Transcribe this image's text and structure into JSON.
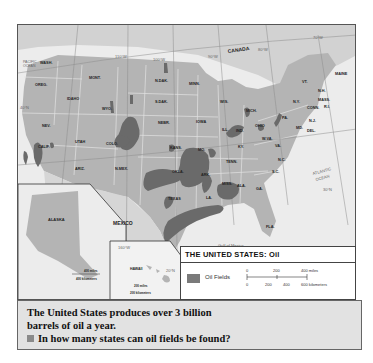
{
  "map": {
    "title": "THE UNITED STATES: Oil",
    "countries": {
      "canada": "CANADA",
      "mexico": "MEXICO"
    },
    "oceans": {
      "pacific": "PACIFIC OCEAN",
      "atlantic": "ATLANTIC OCEAN",
      "gulf": "Gulf of Mexico"
    },
    "meridians": [
      "110°W",
      "100°W",
      "90°W",
      "80°W",
      "70°W"
    ],
    "parallels": [
      "40°N",
      "30°N",
      "20°N"
    ],
    "states": [
      {
        "abbr": "WASH.",
        "x": 22,
        "y": 39
      },
      {
        "abbr": "OREG.",
        "x": 17,
        "y": 61
      },
      {
        "abbr": "IDAHO",
        "x": 49,
        "y": 75
      },
      {
        "abbr": "MONT.",
        "x": 71,
        "y": 54
      },
      {
        "abbr": "WYO.",
        "x": 84,
        "y": 85
      },
      {
        "abbr": "N.DAK.",
        "x": 137,
        "y": 57
      },
      {
        "abbr": "S.DAK.",
        "x": 137,
        "y": 78
      },
      {
        "abbr": "NEBR.",
        "x": 140,
        "y": 99
      },
      {
        "abbr": "NEV.",
        "x": 24,
        "y": 102
      },
      {
        "abbr": "UTAH",
        "x": 57,
        "y": 118
      },
      {
        "abbr": "COLO.",
        "x": 88,
        "y": 120
      },
      {
        "abbr": "CALIF.",
        "x": 20,
        "y": 123
      },
      {
        "abbr": "ARIZ.",
        "x": 57,
        "y": 145
      },
      {
        "abbr": "N.MEX.",
        "x": 97,
        "y": 145
      },
      {
        "abbr": "KANS.",
        "x": 152,
        "y": 124
      },
      {
        "abbr": "OKLA.",
        "x": 154,
        "y": 148
      },
      {
        "abbr": "TEXAS",
        "x": 150,
        "y": 175
      },
      {
        "abbr": "MINN.",
        "x": 171,
        "y": 60
      },
      {
        "abbr": "IOWA",
        "x": 178,
        "y": 98
      },
      {
        "abbr": "MO.",
        "x": 180,
        "y": 126
      },
      {
        "abbr": "ARK.",
        "x": 183,
        "y": 151
      },
      {
        "abbr": "LA.",
        "x": 188,
        "y": 174
      },
      {
        "abbr": "WIS.",
        "x": 202,
        "y": 78
      },
      {
        "abbr": "ILL.",
        "x": 204,
        "y": 106
      },
      {
        "abbr": "MICH.",
        "x": 228,
        "y": 87
      },
      {
        "abbr": "IND.",
        "x": 218,
        "y": 107
      },
      {
        "abbr": "OHIO",
        "x": 237,
        "y": 102
      },
      {
        "abbr": "KY.",
        "x": 220,
        "y": 123
      },
      {
        "abbr": "TENN.",
        "x": 208,
        "y": 138
      },
      {
        "abbr": "MISS.",
        "x": 204,
        "y": 160
      },
      {
        "abbr": "ALA.",
        "x": 219,
        "y": 162
      },
      {
        "abbr": "GA.",
        "x": 238,
        "y": 165
      },
      {
        "abbr": "FLA.",
        "x": 248,
        "y": 203
      },
      {
        "abbr": "S.C.",
        "x": 254,
        "y": 148
      },
      {
        "abbr": "N.C.",
        "x": 260,
        "y": 136
      },
      {
        "abbr": "VA.",
        "x": 257,
        "y": 122
      },
      {
        "abbr": "W.VA.",
        "x": 244,
        "y": 115
      },
      {
        "abbr": "PA.",
        "x": 264,
        "y": 94
      },
      {
        "abbr": "N.Y.",
        "x": 275,
        "y": 78
      },
      {
        "abbr": "MD.",
        "x": 278,
        "y": 104
      },
      {
        "abbr": "DEL.",
        "x": 289,
        "y": 107
      },
      {
        "abbr": "N.J.",
        "x": 291,
        "y": 97
      },
      {
        "abbr": "CONN.",
        "x": 289,
        "y": 84
      },
      {
        "abbr": "R.I.",
        "x": 306,
        "y": 83
      },
      {
        "abbr": "MASS.",
        "x": 300,
        "y": 76
      },
      {
        "abbr": "N.H.",
        "x": 300,
        "y": 67
      },
      {
        "abbr": "VT.",
        "x": 284,
        "y": 58
      },
      {
        "abbr": "MAINE",
        "x": 317,
        "y": 50
      }
    ],
    "insets": {
      "alaska": {
        "label": "ALASKA",
        "scale_miles": "400 miles",
        "scale_km": "400 kilometers"
      },
      "hawaii": {
        "label": "HAWAII",
        "meridian": "160°W",
        "parallel": "20°N",
        "meridian2": "155°W",
        "scale_miles": "200 miles",
        "scale_km": "200 kilometers"
      }
    }
  },
  "legend": {
    "title": "THE UNITED STATES: Oil",
    "items": [
      {
        "label": "Oil Fields",
        "color": "#7a7a7a"
      }
    ],
    "scale": {
      "miles": [
        "0",
        "200",
        "400 miles"
      ],
      "km": [
        "0",
        "200",
        "400",
        "600 kilometers"
      ]
    }
  },
  "caption": {
    "line1": "The United States produces over 3 billion",
    "line2": "barrels of oil a year.",
    "question": "In how many states can oil fields be found?"
  },
  "colors": {
    "land": "#b8b8b8",
    "water": "#ececec",
    "oil": "#6e6e6e",
    "foreign": "#d0d0d0"
  }
}
